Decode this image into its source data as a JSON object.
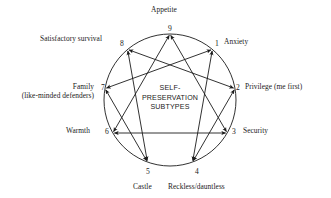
{
  "diagram": {
    "kind": "enneagram",
    "center_title_lines": [
      "SELF-",
      "PRESERVATION",
      "SUBTYPES"
    ],
    "geometry": {
      "cx": 170,
      "cy": 100,
      "r": 66,
      "stroke_color": "#1b1b1b"
    },
    "points": [
      {
        "id": "p9",
        "number": "9",
        "label": "Appetite",
        "label_lines": [
          "Appetite"
        ],
        "angle_deg": -90,
        "label_pos": "top"
      },
      {
        "id": "p1",
        "number": "1",
        "label": "Anxiety",
        "label_lines": [
          "Anxiety"
        ],
        "angle_deg": -50,
        "label_pos": "right"
      },
      {
        "id": "p2",
        "number": "2",
        "label": "Privilege (me first)",
        "label_lines": [
          "Privilege (me first)"
        ],
        "angle_deg": -10,
        "label_pos": "right"
      },
      {
        "id": "p3",
        "number": "3",
        "label": "Security",
        "label_lines": [
          "Security"
        ],
        "angle_deg": 30,
        "label_pos": "right"
      },
      {
        "id": "p4",
        "number": "4",
        "label": "Reckless/dauntless",
        "label_lines": [
          "Reckless/dauntless"
        ],
        "angle_deg": 70,
        "label_pos": "bottom"
      },
      {
        "id": "p5",
        "number": "5",
        "label": "Castle",
        "label_lines": [
          "Castle"
        ],
        "angle_deg": 110,
        "label_pos": "bottom"
      },
      {
        "id": "p6",
        "number": "6",
        "label": "Warmth",
        "label_lines": [
          "Warmth"
        ],
        "angle_deg": 150,
        "label_pos": "left"
      },
      {
        "id": "p7",
        "number": "7",
        "label": "Family (like-minded defenders)",
        "label_lines": [
          "Family",
          "(like-minded defenders)"
        ],
        "angle_deg": 190,
        "label_pos": "left"
      },
      {
        "id": "p8",
        "number": "8",
        "label": "Satisfactory survival",
        "label_lines": [
          "Satisfactory survival"
        ],
        "angle_deg": 230,
        "label_pos": "left"
      }
    ],
    "connections": [
      {
        "from": "9",
        "to": "3",
        "arrows": "both"
      },
      {
        "from": "3",
        "to": "6",
        "arrows": "both"
      },
      {
        "from": "6",
        "to": "9",
        "arrows": "both"
      },
      {
        "from": "1",
        "to": "4",
        "arrows": "both"
      },
      {
        "from": "4",
        "to": "2",
        "arrows": "both"
      },
      {
        "from": "2",
        "to": "8",
        "arrows": "both"
      },
      {
        "from": "8",
        "to": "5",
        "arrows": "both"
      },
      {
        "from": "5",
        "to": "7",
        "arrows": "both"
      },
      {
        "from": "7",
        "to": "1",
        "arrows": "both"
      }
    ]
  }
}
